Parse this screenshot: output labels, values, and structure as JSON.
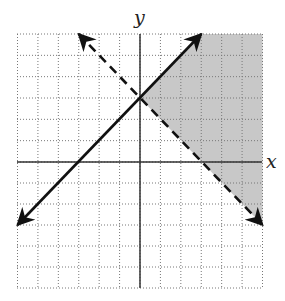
{
  "chart_data": {
    "type": "diagram",
    "title": "",
    "xlabel": "x",
    "ylabel": "y",
    "xlim": [
      -6,
      6
    ],
    "ylim": [
      -6,
      6
    ],
    "grid": true,
    "grid_style": "dotted",
    "lines": [
      {
        "name": "boundary-solid",
        "equation": "y = x + 3",
        "style": "solid",
        "from": [
          -6,
          -3
        ],
        "to": [
          3,
          6
        ],
        "arrows": "both"
      },
      {
        "name": "boundary-dashed",
        "equation": "y = -x + 3",
        "style": "dashed",
        "from": [
          -3,
          6
        ],
        "to": [
          6,
          -3
        ],
        "arrows": "both"
      }
    ],
    "shaded_region": {
      "description": "y < x + 3 and y > -x + 3",
      "vertices": [
        [
          0,
          3
        ],
        [
          3,
          6
        ],
        [
          6,
          6
        ],
        [
          6,
          -3
        ]
      ],
      "color": "#c8c8c8"
    },
    "intersection": [
      0,
      3
    ]
  },
  "labels": {
    "x_axis": "x",
    "y_axis": "y"
  }
}
